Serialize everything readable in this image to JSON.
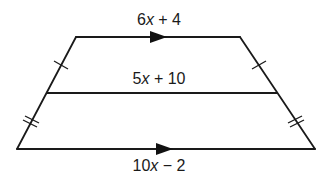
{
  "diagram": {
    "type": "trapezoid-with-midsegment",
    "background": "#ffffff",
    "stroke_color": "#1a1a1a",
    "vertices": {
      "top_left": [
        76,
        37
      ],
      "top_right": [
        240,
        37
      ],
      "mid_left": [
        47,
        93
      ],
      "mid_right": [
        277,
        93
      ],
      "bottom_left": [
        17,
        149
      ],
      "bottom_right": [
        315,
        149
      ]
    },
    "labels": {
      "top_base": {
        "coef": "6",
        "var": "x",
        "rest": " + 4",
        "full": "6x + 4"
      },
      "midsegment": {
        "coef": "5",
        "var": "x",
        "rest": " + 10",
        "full": "5x + 10"
      },
      "bottom_base": {
        "coef": "10",
        "var": "x",
        "rest": " − 2",
        "full": "10x − 2"
      }
    },
    "markers": {
      "parallel_arrows": [
        "top_base",
        "bottom_base"
      ],
      "single_ticks": [
        "upper-left-leg",
        "upper-right-leg"
      ],
      "double_ticks": [
        "lower-left-leg",
        "lower-right-leg"
      ]
    }
  }
}
